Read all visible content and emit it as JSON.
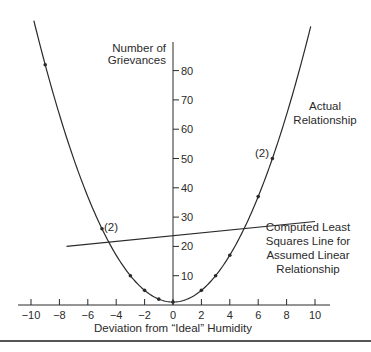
{
  "chart_data": {
    "type": "scatter",
    "title": "",
    "xlabel": "Deviation from “Ideal” Humidity",
    "ylabel": "Number of Grievances",
    "ylabel_lines": [
      "Number of",
      "Grievances"
    ],
    "xlim": [
      -10,
      10
    ],
    "ylim": [
      0,
      85
    ],
    "x_ticks": [
      -10,
      -8,
      -6,
      -4,
      -2,
      0,
      2,
      4,
      6,
      8,
      10
    ],
    "x_tick_labels": [
      "−10",
      "−8",
      "−6",
      "−4",
      "−2",
      "0",
      "2",
      "4",
      "6",
      "8",
      "10"
    ],
    "y_ticks": [
      10,
      20,
      30,
      40,
      50,
      60,
      70,
      80
    ],
    "y_tick_labels": [
      "10",
      "20",
      "30",
      "40",
      "50",
      "60",
      "70",
      "80"
    ],
    "grid": false,
    "legend": null,
    "series": [
      {
        "name": "Observed data",
        "kind": "points",
        "x": [
          -9,
          -5,
          -3,
          -2,
          -1,
          0,
          2,
          3,
          4,
          6,
          7
        ],
        "y": [
          83,
          26,
          10,
          5,
          2,
          1,
          5,
          10,
          17,
          37,
          50
        ],
        "multiplicity": [
          1,
          2,
          1,
          1,
          1,
          1,
          1,
          1,
          1,
          1,
          2
        ]
      },
      {
        "name": "Actual Relationship",
        "kind": "curve",
        "equation": "y = x^2 + 1",
        "x_range": [
          -9.8,
          9.7
        ]
      },
      {
        "name": "Computed Least Squares Line for Assumed Linear Relationship",
        "kind": "line",
        "x": [
          -7.5,
          10
        ],
        "y": [
          20,
          28.5
        ]
      }
    ],
    "annotations": [
      {
        "text": "(2)",
        "x": -5,
        "y": 26
      },
      {
        "text": "(2)",
        "x": 7,
        "y": 50
      },
      {
        "text": "Actual Relationship",
        "lines": [
          "Actual",
          "Relationship"
        ]
      },
      {
        "text": "Computed Least Squares Line for Assumed Linear Relationship",
        "lines": [
          "Computed Least",
          "Squares Line for",
          "Assumed Linear",
          "Relationship"
        ]
      }
    ]
  },
  "labels": {
    "y_title_1": "Number of",
    "y_title_2": "Grievances",
    "x_title": "Deviation from “Ideal” Humidity",
    "actual_1": "Actual",
    "actual_2": "Relationship",
    "ls_1": "Computed Least",
    "ls_2": "Squares Line for",
    "ls_3": "Assumed Linear",
    "ls_4": "Relationship",
    "mult_left": "(2)",
    "mult_right": "(2)"
  },
  "colors": {
    "ink": "#2a2a2a",
    "background": "#ffffff"
  }
}
